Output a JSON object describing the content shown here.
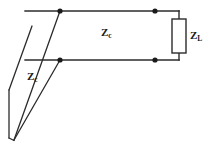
{
  "figure": {
    "type": "circuit-schematic",
    "background_color": "#ffffff",
    "line_color": "#2b2b2b",
    "text_color": "#1a1a1a"
  },
  "labels": {
    "line_impedance": {
      "symbol": "Z",
      "subscript": "c"
    },
    "perspective_line_impedance": {
      "symbol": "Z",
      "subscript": "c"
    },
    "load_impedance": {
      "symbol": "Z",
      "subscript": "L"
    }
  },
  "geometry": {
    "top_conductor": {
      "x1": 25,
      "y1": 11,
      "x2": 179,
      "y2": 11
    },
    "bottom_conductor": {
      "x1": 25,
      "y1": 60,
      "x2": 179,
      "y2": 60
    },
    "top_right_drop": {
      "x1": 179,
      "y1": 11,
      "x2": 179,
      "y2": 19
    },
    "bottom_right_rise": {
      "x1": 179,
      "y1": 60,
      "x2": 179,
      "y2": 53
    },
    "load_rect": {
      "x": 172,
      "y": 19,
      "width": 14,
      "height": 34
    },
    "diagonal_upper": {
      "x1": 60,
      "y1": 11,
      "x2": 14,
      "y2": 140
    },
    "diagonal_lower": {
      "x1": 60,
      "y1": 60,
      "x2": 14,
      "y2": 140
    },
    "vertical_left": {
      "x1": 9,
      "y1": 90,
      "x2": 9,
      "y2": 138
    },
    "vertical_left_join": {
      "x1": 9,
      "y1": 138,
      "x2": 14,
      "y2": 140
    },
    "vertical_left_top_join": {
      "x1": 9,
      "y1": 90,
      "x2": 32,
      "y2": 26
    },
    "nodes": [
      {
        "cx": 60,
        "cy": 11,
        "r": 2.6,
        "name": "node-top-left"
      },
      {
        "cx": 60,
        "cy": 60,
        "r": 2.6,
        "name": "node-bottom-left"
      },
      {
        "cx": 155,
        "cy": 11,
        "r": 2.6,
        "name": "node-top-right"
      },
      {
        "cx": 155,
        "cy": 60,
        "r": 2.6,
        "name": "node-bottom-right"
      }
    ]
  }
}
